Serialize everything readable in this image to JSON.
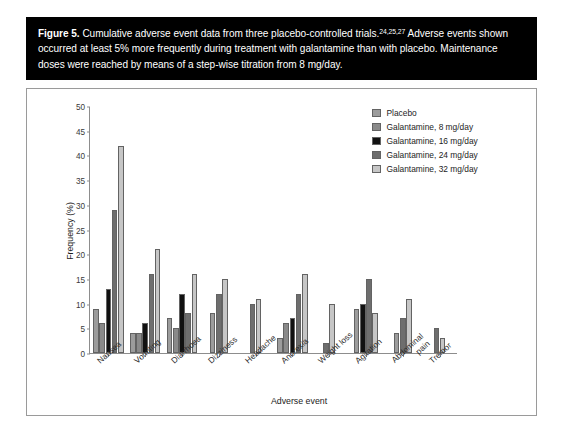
{
  "caption": {
    "figure_number": "Figure 5.",
    "line1_a": " Cumulative adverse event data from three placebo-controlled trials.",
    "superscript": "24,25,27",
    "line1_b": " Adverse events shown occurred at least 5% more frequently during treatment with galantamine than with placebo. Maintenance doses were reached by means of a step-wise titration from 8 mg/day."
  },
  "chart_data": {
    "type": "bar",
    "title": "",
    "xlabel": "Adverse event",
    "ylabel": "Frequency (%)",
    "ylim": [
      0,
      50
    ],
    "yticks": [
      0,
      5,
      10,
      15,
      20,
      25,
      30,
      35,
      40,
      45,
      50
    ],
    "grid": false,
    "legend_position": "top-right",
    "categories": [
      "Nausea",
      "Vomiting",
      "Diarrhoea",
      "Dizziness",
      "Headache",
      "Anorexia",
      "Weight loss",
      "Agitation",
      "Abdominal pain",
      "Tremor"
    ],
    "series": [
      {
        "name": "Placebo",
        "color": "#9c9c9c",
        "values": [
          9,
          4,
          7,
          8,
          null,
          3,
          null,
          9,
          4,
          null
        ]
      },
      {
        "name": "Galantamine, 8 mg/day",
        "color": "#8a8a8a",
        "values": [
          6,
          4,
          5,
          null,
          null,
          6,
          null,
          null,
          null,
          null
        ]
      },
      {
        "name": "Galantamine, 16 mg/day",
        "color": "#111111",
        "values": [
          13,
          6,
          12,
          null,
          null,
          7,
          null,
          10,
          null,
          null
        ]
      },
      {
        "name": "Galantamine, 24 mg/day",
        "color": "#6e6e6e",
        "values": [
          29,
          16,
          8,
          12,
          10,
          12,
          2,
          15,
          7,
          5
        ]
      },
      {
        "name": "Galantamine, 32 mg/day",
        "color": "#c6c6c6",
        "values": [
          42,
          21,
          16,
          15,
          11,
          16,
          10,
          8,
          11,
          3
        ]
      }
    ]
  }
}
